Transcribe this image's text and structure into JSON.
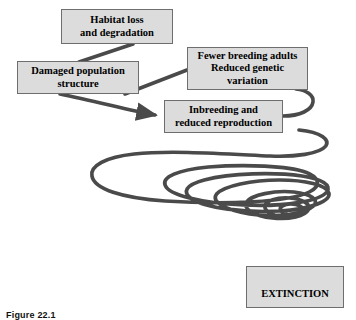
{
  "figure": {
    "caption": "Figure 22.1"
  },
  "colors": {
    "box_fill": "#dcdcdc",
    "box_border": "#6e6e6e",
    "spiral_line": "#4a4a4a",
    "connector_line": "#4a4a4a",
    "text": "#000000",
    "background": "#ffffff"
  },
  "nodes": [
    {
      "id": "habitat-loss",
      "label": "Habitat loss\nand degradation"
    },
    {
      "id": "damaged-population",
      "label": "Damaged population\nstructure"
    },
    {
      "id": "fewer-breeding",
      "label": "Fewer breeding adults\nReduced genetic\nvariation"
    },
    {
      "id": "inbreeding",
      "label": "Inbreeding and\nreduced reproduction"
    },
    {
      "id": "extinction",
      "label": "EXTINCTION"
    }
  ],
  "connectors": [
    {
      "id": "habitat-to-damaged",
      "from": "habitat-loss",
      "to": "damaged-population",
      "arrowhead": false
    },
    {
      "id": "damaged-to-fewer",
      "from": "damaged-population",
      "to": "fewer-breeding",
      "arrowhead": false
    },
    {
      "id": "damaged-to-inbreeding",
      "from": "damaged-population",
      "to": "inbreeding",
      "arrowhead": true
    },
    {
      "id": "fewer-to-inbreeding-loop",
      "from": "fewer-breeding",
      "to": "inbreeding",
      "arrowhead": false
    }
  ],
  "spiral": {
    "id": "extinction-vortex",
    "description": "Downward narrowing spiral ending at the EXTINCTION box",
    "loops": 7,
    "stroke_width": 3.6
  }
}
